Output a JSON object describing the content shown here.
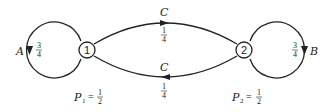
{
  "diagram": {
    "type": "state-transition",
    "nodes": [
      {
        "id": "1",
        "label": "1",
        "cx": 87,
        "cy": 50
      },
      {
        "id": "2",
        "label": "2",
        "cx": 244,
        "cy": 50
      }
    ],
    "edges": [
      {
        "from": "1",
        "to": "1",
        "name": "A",
        "prob_num": "3",
        "prob_den": "4"
      },
      {
        "from": "2",
        "to": "2",
        "name": "B",
        "prob_num": "3",
        "prob_den": "4"
      },
      {
        "from": "1",
        "to": "2",
        "name": "C",
        "prob_num": "1",
        "prob_den": "4"
      },
      {
        "from": "2",
        "to": "1",
        "name": "C",
        "prob_num": "1",
        "prob_den": "4"
      }
    ],
    "stationary": [
      {
        "symbol": "P",
        "sub": "1",
        "eq": "=",
        "num": "1",
        "den": "2"
      },
      {
        "symbol": "P",
        "sub": "2",
        "eq": "=",
        "num": "1",
        "den": "2"
      }
    ]
  },
  "colors": {
    "stroke": "#222222",
    "background": "#ffffff"
  }
}
